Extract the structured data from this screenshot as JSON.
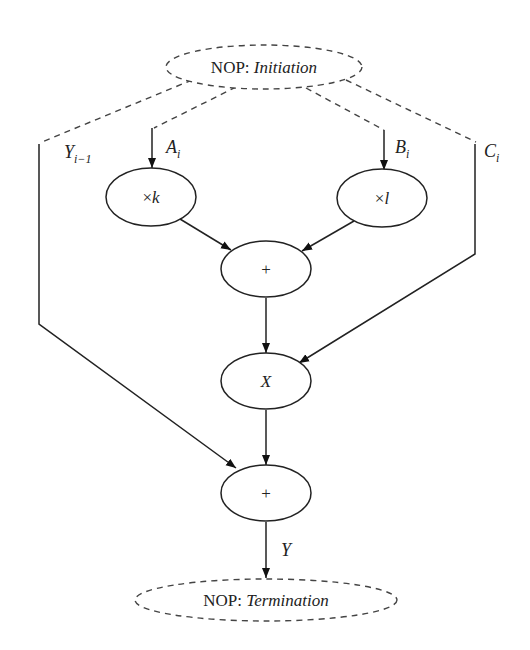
{
  "diagram": {
    "type": "dataflow-graph",
    "colors": {
      "stroke": "#222222",
      "dashed": "#444444",
      "background": "#ffffff"
    },
    "nodes": [
      {
        "id": "init",
        "prefix": "NOP: ",
        "label": "Initiation",
        "style": "dashed"
      },
      {
        "id": "mulk",
        "prefix": "×",
        "label": "k",
        "style": "solid"
      },
      {
        "id": "mull",
        "prefix": "×",
        "label": "l",
        "style": "solid"
      },
      {
        "id": "add1",
        "label": "+",
        "style": "solid"
      },
      {
        "id": "x",
        "label": "X",
        "style": "solid"
      },
      {
        "id": "add2",
        "label": "+",
        "style": "solid"
      },
      {
        "id": "term",
        "prefix": "NOP: ",
        "label": "Termination",
        "style": "dashed"
      }
    ],
    "edge_labels": {
      "y_prev": {
        "base": "Y",
        "sub": "i−1"
      },
      "a": {
        "base": "A",
        "sub": "i"
      },
      "b": {
        "base": "B",
        "sub": "i"
      },
      "c": {
        "base": "C",
        "sub": "i"
      },
      "y": {
        "base": "Y"
      }
    },
    "edges": [
      {
        "from": "init",
        "to": "add2",
        "label": "Y_{i-1}",
        "style": "dashed-then-solid"
      },
      {
        "from": "init",
        "to": "mulk",
        "label": "A_i",
        "style": "dashed-then-solid"
      },
      {
        "from": "init",
        "to": "mull",
        "label": "B_i",
        "style": "dashed-then-solid"
      },
      {
        "from": "init",
        "to": "x",
        "label": "C_i",
        "style": "dashed-then-solid"
      },
      {
        "from": "mulk",
        "to": "add1"
      },
      {
        "from": "mull",
        "to": "add1"
      },
      {
        "from": "add1",
        "to": "x"
      },
      {
        "from": "x",
        "to": "add2"
      },
      {
        "from": "add2",
        "to": "term",
        "label": "Y"
      }
    ]
  }
}
